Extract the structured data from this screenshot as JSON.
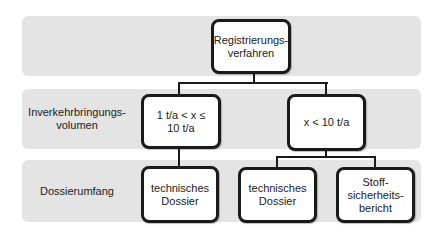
{
  "bands": [
    {
      "label": ""
    },
    {
      "label": "Inverkehrbringungs-\nvolumen"
    },
    {
      "label": "Dossierumfang"
    }
  ],
  "nodes": {
    "root": "Registrierungs-\nverfahren",
    "volume_low": "1 t/a < x ≤\n10 t/a",
    "volume_high": "x < 10 t/a",
    "dossier_left": "technisches\nDossier",
    "dossier_right": "technisches\nDossier",
    "safety_report": "Stoff-\nsicherheits-\nbericht"
  },
  "colors": {
    "band": "#e4e4e4",
    "node_border": "#1a1a1a",
    "node_fill": "#ffffff"
  }
}
